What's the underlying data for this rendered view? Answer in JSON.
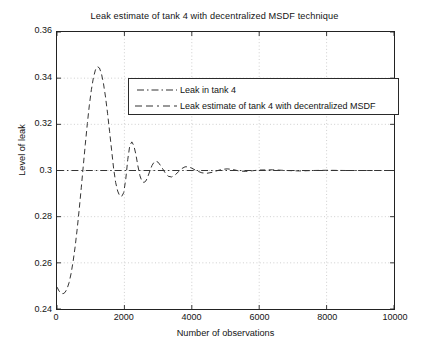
{
  "chart_data": {
    "type": "line",
    "title": "Leak estimate of tank 4 with decentralized MSDF technique",
    "xlabel": "Number of observations",
    "ylabel": "Level of leak",
    "xlim": [
      0,
      10000
    ],
    "ylim": [
      0.24,
      0.36
    ],
    "xticks": [
      0,
      2000,
      4000,
      6000,
      8000,
      10000
    ],
    "xtick_labels": [
      "0",
      "2000",
      "4000",
      "6000",
      "8000",
      "10000"
    ],
    "yticks": [
      0.24,
      0.26,
      0.28,
      0.3,
      0.32,
      0.34,
      0.36
    ],
    "ytick_labels": [
      "0.24",
      "0.26",
      "0.28",
      "0.3",
      "0.32",
      "0.34",
      "0.36"
    ],
    "grid": true,
    "grid_style": "dotted",
    "legend_position": "upper center",
    "line_color": "#333333",
    "grid_color": "#b9b9b9",
    "axis_color": "#222222",
    "series": [
      {
        "name": "Leak in tank 4",
        "style": "dashdot",
        "constant_value": 0.3,
        "x": [
          0,
          10000
        ],
        "values": [
          0.3,
          0.3
        ]
      },
      {
        "name": "Leak estimate of tank 4 with decentralized MSDF",
        "style": "dashed",
        "x": [
          0,
          60,
          120,
          180,
          240,
          300,
          360,
          420,
          480,
          540,
          600,
          660,
          720,
          780,
          840,
          900,
          960,
          1020,
          1080,
          1140,
          1200,
          1260,
          1320,
          1380,
          1440,
          1500,
          1560,
          1620,
          1680,
          1740,
          1800,
          1860,
          1920,
          1980,
          2040,
          2100,
          2160,
          2220,
          2280,
          2340,
          2400,
          2460,
          2520,
          2580,
          2640,
          2700,
          2760,
          2820,
          2880,
          2940,
          3000,
          3100,
          3200,
          3300,
          3400,
          3500,
          3600,
          3700,
          3800,
          3900,
          4000,
          4150,
          4300,
          4450,
          4600,
          4750,
          4900,
          5050,
          5200,
          5400,
          5600,
          5800,
          6000,
          6400,
          6800,
          7200,
          7600,
          8000,
          8600,
          9200,
          10000
        ],
        "values": [
          0.2495,
          0.2478,
          0.2468,
          0.2466,
          0.2472,
          0.2488,
          0.2515,
          0.2555,
          0.2608,
          0.2672,
          0.2748,
          0.2833,
          0.2925,
          0.302,
          0.3114,
          0.3203,
          0.3283,
          0.335,
          0.3402,
          0.3436,
          0.345,
          0.3444,
          0.3419,
          0.3376,
          0.3318,
          0.3248,
          0.317,
          0.3089,
          0.3009,
          0.2948,
          0.2911,
          0.289,
          0.2888,
          0.2904,
          0.2962,
          0.3048,
          0.3108,
          0.3124,
          0.3108,
          0.307,
          0.302,
          0.2978,
          0.2953,
          0.2948,
          0.2955,
          0.2975,
          0.3,
          0.3022,
          0.3036,
          0.304,
          0.3036,
          0.3016,
          0.2992,
          0.2975,
          0.2972,
          0.298,
          0.2994,
          0.3008,
          0.3016,
          0.3016,
          0.301,
          0.2998,
          0.299,
          0.2988,
          0.2992,
          0.2999,
          0.3005,
          0.3007,
          0.3005,
          0.2998,
          0.2996,
          0.2999,
          0.3002,
          0.3003,
          0.3,
          0.2998,
          0.3,
          0.3001,
          0.3,
          0.3,
          0.3
        ]
      }
    ]
  },
  "legend": {
    "items": [
      {
        "label": "Leak in tank 4",
        "style": "dashdot"
      },
      {
        "label": "Leak estimate of tank 4 with decentralized MSDF",
        "style": "dashed"
      }
    ]
  }
}
